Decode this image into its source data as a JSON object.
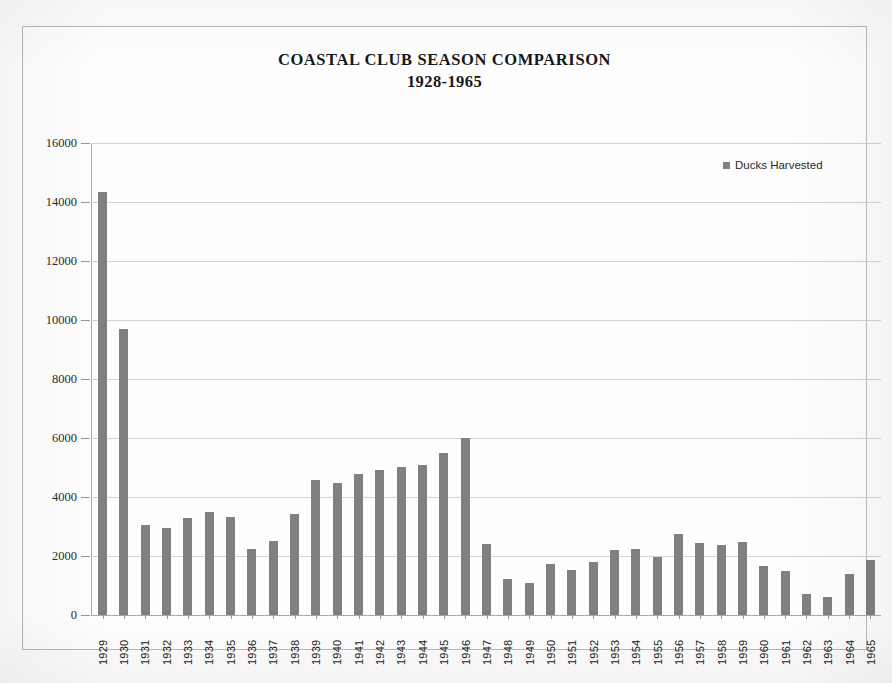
{
  "chart_data": {
    "type": "bar",
    "title": "COASTAL CLUB SEASON COMPARISON",
    "subtitle": "1928-1965",
    "xlabel": "",
    "ylabel": "",
    "ylim": [
      0,
      16000
    ],
    "yticks": [
      0,
      2000,
      4000,
      6000,
      8000,
      10000,
      12000,
      14000,
      16000
    ],
    "ytick_labels": [
      "0",
      "2000",
      "4000",
      "6000",
      "8000",
      "10000",
      "12000",
      "14000",
      "16000"
    ],
    "grid": true,
    "legend_position": "top-right",
    "series": [
      {
        "name": "Ducks Harvested",
        "color": "#808080",
        "values": [
          14350,
          9700,
          3050,
          2960,
          3300,
          3500,
          3320,
          2230,
          2500,
          3420,
          4560,
          4480,
          4780,
          4900,
          5020,
          5100,
          5500,
          6000,
          2400,
          1230,
          1100,
          1740,
          1540,
          1800,
          2200,
          2250,
          1950,
          2760,
          2440,
          2380,
          2490,
          1650,
          1500,
          720,
          600,
          1400,
          1880
        ]
      }
    ],
    "categories": [
      "1929",
      "1930",
      "1931",
      "1932",
      "1933",
      "1934",
      "1935",
      "1936",
      "1937",
      "1938",
      "1939",
      "1940",
      "1941",
      "1942",
      "1943",
      "1944",
      "1945",
      "1946",
      "1947",
      "1948",
      "1949",
      "1950",
      "1951",
      "1952",
      "1953",
      "1954",
      "1955",
      "1956",
      "1957",
      "1958",
      "1959",
      "1960",
      "1961",
      "1962",
      "1963",
      "1964",
      "1965"
    ]
  },
  "legend": {
    "label": "Ducks Harvested",
    "swatch_color": "#808080"
  },
  "colors": {
    "bar": "#808080",
    "grid": "#d3d3d3",
    "axis": "#a8a8a8",
    "frame": "#b9b9b9",
    "text": "#17171a"
  }
}
